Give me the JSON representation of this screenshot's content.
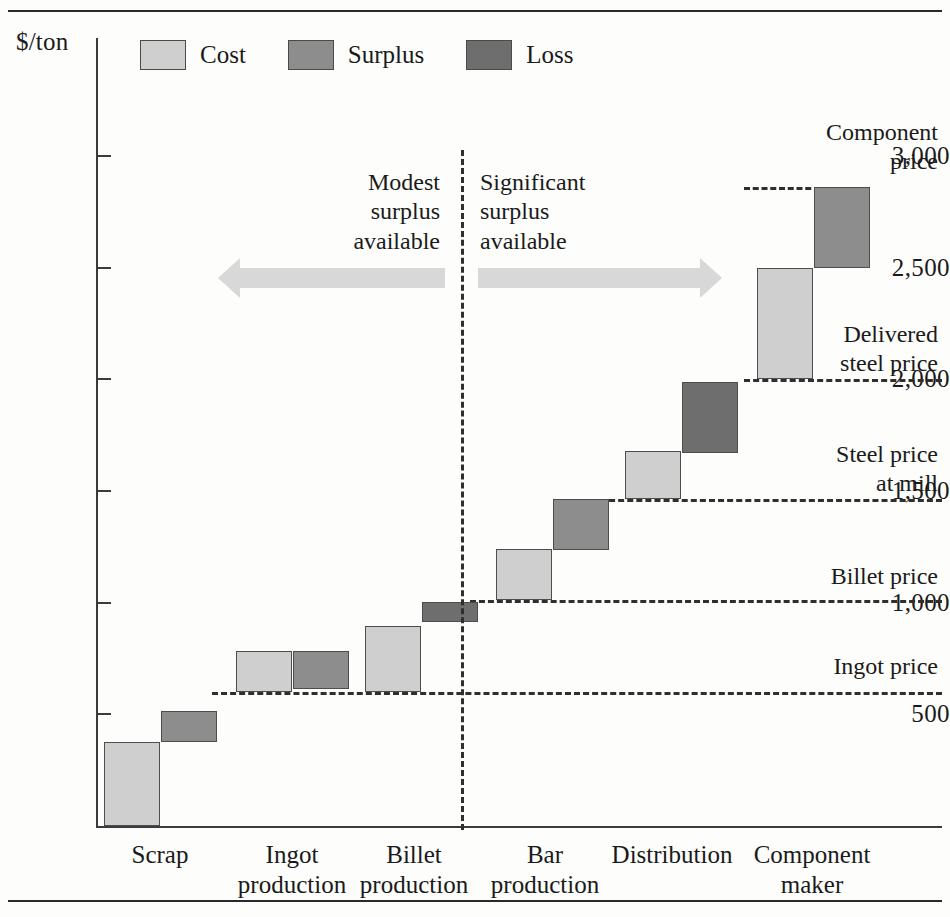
{
  "chart_data": {
    "type": "bar",
    "subtype": "waterfall",
    "title": "",
    "xlabel": "",
    "ylabel": "$/ton",
    "ylim": [
      0,
      3150
    ],
    "yticks": [
      500,
      1000,
      1500,
      2000,
      2500,
      3000
    ],
    "ytick_labels": [
      "500",
      "1,000",
      "1,500",
      "2,000",
      "2,500",
      "3,000"
    ],
    "grid": false,
    "legend": {
      "position": "top-left",
      "entries": [
        {
          "label": "Cost",
          "color": "#cfcfcf"
        },
        {
          "label": "Surplus",
          "color": "#8d8d8d"
        },
        {
          "label": "Loss",
          "color": "#6e6e6e"
        }
      ]
    },
    "categories": [
      "Scrap",
      "Ingot production",
      "Billet production",
      "Bar production",
      "Distribution",
      "Component maker"
    ],
    "category_lines": [
      [
        "Scrap",
        ""
      ],
      [
        "Ingot",
        "production"
      ],
      [
        "Billet",
        "production"
      ],
      [
        "Bar",
        "production"
      ],
      [
        "Distribution",
        ""
      ],
      [
        "Component",
        "maker"
      ]
    ],
    "segments": [
      {
        "category": "Scrap",
        "kind": "Cost",
        "bottom": 0,
        "top": 375
      },
      {
        "category": "Scrap",
        "kind": "Surplus",
        "bottom": 375,
        "top": 515
      },
      {
        "category": "Ingot production",
        "kind": "Cost",
        "bottom": 600,
        "top": 785
      },
      {
        "category": "Ingot production",
        "kind": "Surplus",
        "bottom": 615,
        "top": 785
      },
      {
        "category": "Billet production",
        "kind": "Cost",
        "bottom": 600,
        "top": 895
      },
      {
        "category": "Billet production",
        "kind": "Loss",
        "bottom": 915,
        "top": 1005
      },
      {
        "category": "Bar production",
        "kind": "Cost",
        "bottom": 1010,
        "top": 1240
      },
      {
        "category": "Bar production",
        "kind": "Surplus",
        "bottom": 1235,
        "top": 1465
      },
      {
        "category": "Distribution",
        "kind": "Cost",
        "bottom": 1465,
        "top": 1680
      },
      {
        "category": "Distribution",
        "kind": "Loss",
        "bottom": 1670,
        "top": 1990
      },
      {
        "category": "Component maker",
        "kind": "Cost",
        "bottom": 2000,
        "top": 2500
      },
      {
        "category": "Component maker",
        "kind": "Surplus",
        "bottom": 2500,
        "top": 2860
      }
    ],
    "reference_lines": [
      {
        "label": "Component price",
        "label_lines": [
          "Component",
          "price"
        ],
        "value": 2860
      },
      {
        "label": "Delivered steel price",
        "label_lines": [
          "Delivered",
          "steel price"
        ],
        "value": 2000
      },
      {
        "label": "Steel price at mill",
        "label_lines": [
          "Steel price",
          "at mill"
        ],
        "value": 1465
      },
      {
        "label": "Billet price",
        "label_lines": [
          "Billet price",
          ""
        ],
        "value": 1010
      },
      {
        "label": "Ingot price",
        "label_lines": [
          "Ingot price",
          ""
        ],
        "value": 600
      }
    ],
    "annotations": [
      {
        "name": "modest-surplus",
        "lines": [
          "Modest",
          "surplus",
          "available"
        ],
        "align": "right"
      },
      {
        "name": "significant-surplus",
        "lines": [
          "Significant",
          "surplus",
          "available"
        ],
        "align": "left"
      }
    ],
    "arrows": [
      {
        "name": "modest-surplus-arrow",
        "direction": "left"
      },
      {
        "name": "significant-surplus-arrow",
        "direction": "right"
      }
    ],
    "divider": {
      "name": "stage-divider",
      "style": "dashed-vertical"
    }
  }
}
